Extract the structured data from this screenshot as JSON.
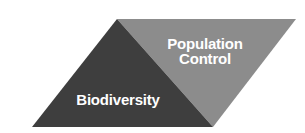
{
  "diagram": {
    "type": "split-parallelogram",
    "background_color": "#ffffff",
    "regions": [
      {
        "id": "biodiversity",
        "label": "Biodiversity",
        "fill_color": "#3e3e3e",
        "text_color": "#ffffff",
        "shape": "triangle",
        "points": "117,19 213,127 32,127"
      },
      {
        "id": "population-control",
        "label": "Population\nControl",
        "label_line1": "Population",
        "label_line2": "Control",
        "fill_color": "#8c8c8c",
        "text_color": "#ffffff",
        "shape": "triangle",
        "points": "117,19 296,19 213,127"
      }
    ],
    "outline": {
      "points": "117,19 296,19 213,127 32,127",
      "divider": "117,19 213,127"
    }
  }
}
